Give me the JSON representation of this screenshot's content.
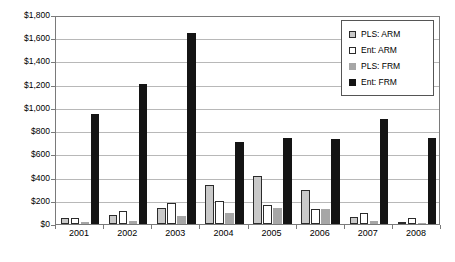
{
  "chart_data": {
    "type": "bar",
    "title": "",
    "xlabel": "",
    "ylabel": "",
    "categories": [
      "2001",
      "2002",
      "2003",
      "2004",
      "2005",
      "2006",
      "2007",
      "2008"
    ],
    "ylim": [
      0,
      1800
    ],
    "ytick_values": [
      0,
      200,
      400,
      600,
      800,
      1000,
      1200,
      1400,
      1600,
      1800
    ],
    "ytick_labels": [
      "$0",
      "$200",
      "$400",
      "$600",
      "$800",
      "$1,000",
      "$1,200",
      "$1,400",
      "$1,600",
      "$1,800"
    ],
    "grid": true,
    "legend_position": "top-right",
    "series": [
      {
        "name": "PLS: ARM",
        "color": "#c9c9c9",
        "edge_color": "#2b2b2b",
        "values": [
          50,
          75,
          140,
          340,
          415,
          290,
          60,
          20
        ]
      },
      {
        "name": "Ent: ARM",
        "color": "#ffffff",
        "edge_color": "#2b2b2b",
        "values": [
          50,
          110,
          180,
          195,
          165,
          130,
          95,
          55
        ]
      },
      {
        "name": "PLS: FRM",
        "color": "#a6a6a6",
        "edge_color": "#a6a6a6",
        "values": [
          20,
          25,
          65,
          95,
          135,
          130,
          30,
          10
        ]
      },
      {
        "name": "Ent: FRM",
        "color": "#141414",
        "edge_color": "#141414",
        "values": [
          950,
          1210,
          1645,
          710,
          740,
          735,
          905,
          745
        ]
      }
    ]
  },
  "legend": {
    "items": [
      {
        "label": "PLS: ARM",
        "swatch": "pls-arm"
      },
      {
        "label": "Ent: ARM",
        "swatch": "ent-arm"
      },
      {
        "label": "PLS: FRM",
        "swatch": "pls-frm"
      },
      {
        "label": "Ent: FRM",
        "swatch": "ent-frm"
      }
    ]
  }
}
